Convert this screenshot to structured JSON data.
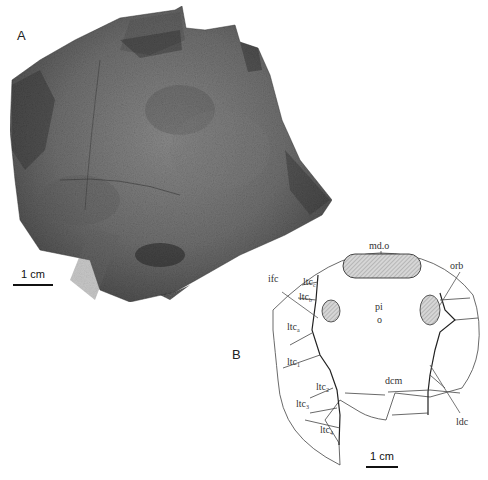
{
  "figure": {
    "panel_a": {
      "letter": "A",
      "content": "photograph of fossil specimen (head shield) in rock matrix",
      "scale_bar": "1 cm"
    },
    "panel_b": {
      "letter": "B",
      "content": "interpretive line drawing of head shield",
      "scale_bar": "1 cm",
      "labels": {
        "mdo": "md.o",
        "orb": "orb",
        "ifc": "ifc",
        "ltc_c": "ltc",
        "ltc_c_sub": "c",
        "ltc_b": "ltc",
        "ltc_b_sub": "b",
        "ltc_a": "ltc",
        "ltc_a_sub": "a",
        "ltc_1": "ltc",
        "ltc_1_sub": "1",
        "ltc_2": "ltc",
        "ltc_2_sub": "2",
        "ltc_3": "ltc",
        "ltc_3_sub": "3",
        "ltc_4": "ltc",
        "ltc_4_sub": "4",
        "pi": "pi",
        "pi_mark": "o",
        "dcm": "dcm",
        "ldc": "ldc"
      }
    }
  }
}
